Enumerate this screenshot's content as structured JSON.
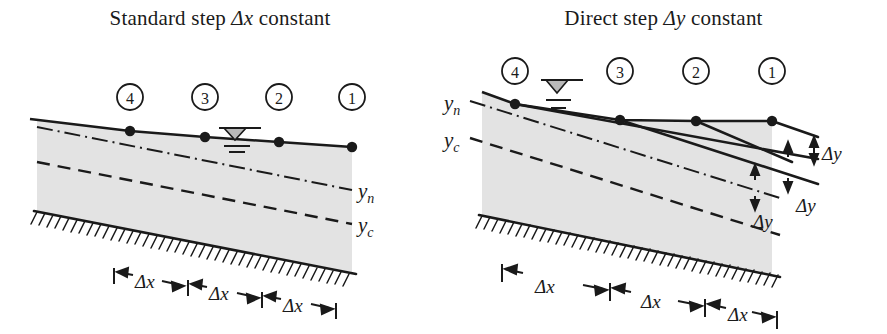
{
  "figure": {
    "background_color": "#ffffff",
    "ink_color": "#1a1a1a",
    "water_fill_color": "#e3e3e3"
  },
  "panels": [
    {
      "id": "standard-step",
      "title_prefix": "Standard step ",
      "title_symbol": "Δx",
      "title_suffix": " constant",
      "nodes": [
        {
          "label": "4",
          "cx": 130,
          "cy": 131,
          "circle_cx": 130,
          "circle_cy": 97
        },
        {
          "label": "3",
          "cx": 205,
          "cy": 137,
          "circle_cx": 205,
          "circle_cy": 97
        },
        {
          "label": "2",
          "cx": 279,
          "cy": 142,
          "circle_cx": 279,
          "circle_cy": 97
        },
        {
          "label": "1",
          "cx": 352,
          "cy": 147,
          "circle_cx": 352,
          "circle_cy": 97
        }
      ],
      "depth_labels": [
        {
          "text": "y",
          "sub": "n",
          "x": 358,
          "y": 192
        },
        {
          "text": "y",
          "sub": "c",
          "x": 358,
          "y": 226
        }
      ],
      "dimensions": [
        {
          "text": "Δx",
          "x": 147,
          "y": 281
        },
        {
          "text": "Δx",
          "x": 222,
          "y": 292
        },
        {
          "text": "Δx",
          "x": 296,
          "y": 303
        }
      ],
      "water_surface_marker": {
        "x": 233,
        "y": 130
      }
    },
    {
      "id": "direct-step",
      "title_prefix": "Direct step ",
      "title_symbol": "Δy",
      "title_suffix": " constant",
      "nodes": [
        {
          "label": "4",
          "cx": 75,
          "cy": 104,
          "circle_cx": 75,
          "circle_cy": 71
        },
        {
          "label": "3",
          "cx": 180,
          "cy": 120,
          "circle_cx": 180,
          "circle_cy": 71
        },
        {
          "label": "2",
          "cx": 256,
          "cy": 121,
          "circle_cx": 256,
          "circle_cy": 71
        },
        {
          "label": "1",
          "cx": 332,
          "cy": 121,
          "circle_cx": 332,
          "circle_cy": 71
        }
      ],
      "depth_labels": [
        {
          "text": "y",
          "sub": "n",
          "x": 6,
          "y": 103
        },
        {
          "text": "y",
          "sub": "c",
          "x": 6,
          "y": 140
        }
      ],
      "dimensions": [
        {
          "text": "Δx",
          "x": 108,
          "y": 285
        },
        {
          "text": "Δx",
          "x": 216,
          "y": 299
        },
        {
          "text": "Δx",
          "x": 302,
          "y": 311
        }
      ],
      "step_labels": [
        {
          "text": "Δy",
          "x": 400,
          "y": 133
        },
        {
          "text": "Δy",
          "x": 377,
          "y": 185
        },
        {
          "text": "Δy",
          "x": 333,
          "y": 199
        }
      ],
      "water_surface_marker": {
        "x": 117,
        "y": 84
      }
    }
  ]
}
